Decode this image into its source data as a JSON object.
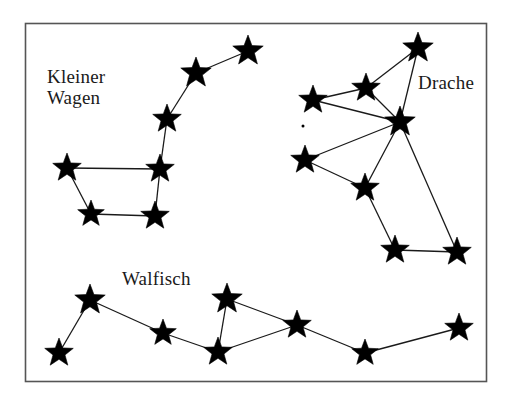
{
  "figure": {
    "background_color": "#ffffff",
    "star_color": "#000000",
    "line_color": "#1a1a1a",
    "border": {
      "name": "figure-frame",
      "color": "#555555",
      "x": 25,
      "y": 23,
      "width": 462,
      "height": 359
    }
  },
  "labels": {
    "kleiner_wagen": "Kleiner\nWagen",
    "drache": "Drache",
    "walfisch": "Walfisch"
  },
  "constellations": [
    {
      "name": "Kleiner Wagen",
      "label": "Kleiner\nWagen",
      "label_position": {
        "x": 47,
        "y": 66
      },
      "stars": [
        {
          "id": "kw1",
          "x": 67,
          "y": 168,
          "size": 15
        },
        {
          "id": "kw2",
          "x": 91,
          "y": 214,
          "size": 14
        },
        {
          "id": "kw3",
          "x": 155,
          "y": 216,
          "size": 15
        },
        {
          "id": "kw4",
          "x": 160,
          "y": 169,
          "size": 15
        },
        {
          "id": "kw5",
          "x": 167,
          "y": 119,
          "size": 15
        },
        {
          "id": "kw6",
          "x": 196,
          "y": 73,
          "size": 16
        },
        {
          "id": "kw7",
          "x": 248,
          "y": 51,
          "size": 16
        }
      ],
      "lines": [
        [
          "kw1",
          "kw4"
        ],
        [
          "kw1",
          "kw2"
        ],
        [
          "kw2",
          "kw3"
        ],
        [
          "kw3",
          "kw4"
        ],
        [
          "kw4",
          "kw5"
        ],
        [
          "kw5",
          "kw6"
        ],
        [
          "kw6",
          "kw7"
        ]
      ]
    },
    {
      "name": "Drache",
      "label": "Drache",
      "label_position": {
        "x": 418,
        "y": 72
      },
      "stars": [
        {
          "id": "dr1",
          "x": 418,
          "y": 48,
          "size": 16
        },
        {
          "id": "dr2",
          "x": 366,
          "y": 88,
          "size": 15
        },
        {
          "id": "dr3",
          "x": 313,
          "y": 100,
          "size": 15
        },
        {
          "id": "dr4",
          "x": 400,
          "y": 122,
          "size": 16
        },
        {
          "id": "dr5",
          "x": 305,
          "y": 160,
          "size": 15
        },
        {
          "id": "dr6",
          "x": 365,
          "y": 188,
          "size": 15
        },
        {
          "id": "dr7",
          "x": 395,
          "y": 250,
          "size": 15
        },
        {
          "id": "dr8",
          "x": 457,
          "y": 252,
          "size": 15
        }
      ],
      "lines": [
        [
          "dr1",
          "dr2"
        ],
        [
          "dr2",
          "dr3"
        ],
        [
          "dr2",
          "dr4"
        ],
        [
          "dr1",
          "dr4"
        ],
        [
          "dr3",
          "dr4"
        ],
        [
          "dr5",
          "dr4"
        ],
        [
          "dr5",
          "dr6"
        ],
        [
          "dr6",
          "dr4"
        ],
        [
          "dr6",
          "dr7"
        ],
        [
          "dr7",
          "dr8"
        ],
        [
          "dr8",
          "dr4"
        ]
      ],
      "faint_dot": {
        "x": 303,
        "y": 126,
        "size": 3
      }
    },
    {
      "name": "Walfisch",
      "label": "Walfisch",
      "label_position": {
        "x": 122,
        "y": 268
      },
      "stars": [
        {
          "id": "wa1",
          "x": 59,
          "y": 353,
          "size": 15
        },
        {
          "id": "wa2",
          "x": 90,
          "y": 300,
          "size": 16
        },
        {
          "id": "wa3",
          "x": 163,
          "y": 333,
          "size": 14
        },
        {
          "id": "wa4",
          "x": 218,
          "y": 352,
          "size": 15
        },
        {
          "id": "wa5",
          "x": 227,
          "y": 299,
          "size": 16
        },
        {
          "id": "wa6",
          "x": 297,
          "y": 325,
          "size": 15
        },
        {
          "id": "wa7",
          "x": 365,
          "y": 353,
          "size": 14
        },
        {
          "id": "wa8",
          "x": 459,
          "y": 328,
          "size": 15
        }
      ],
      "lines": [
        [
          "wa1",
          "wa2"
        ],
        [
          "wa2",
          "wa3"
        ],
        [
          "wa3",
          "wa4"
        ],
        [
          "wa4",
          "wa5"
        ],
        [
          "wa5",
          "wa6"
        ],
        [
          "wa6",
          "wa4"
        ],
        [
          "wa6",
          "wa7"
        ],
        [
          "wa7",
          "wa8"
        ]
      ]
    }
  ]
}
